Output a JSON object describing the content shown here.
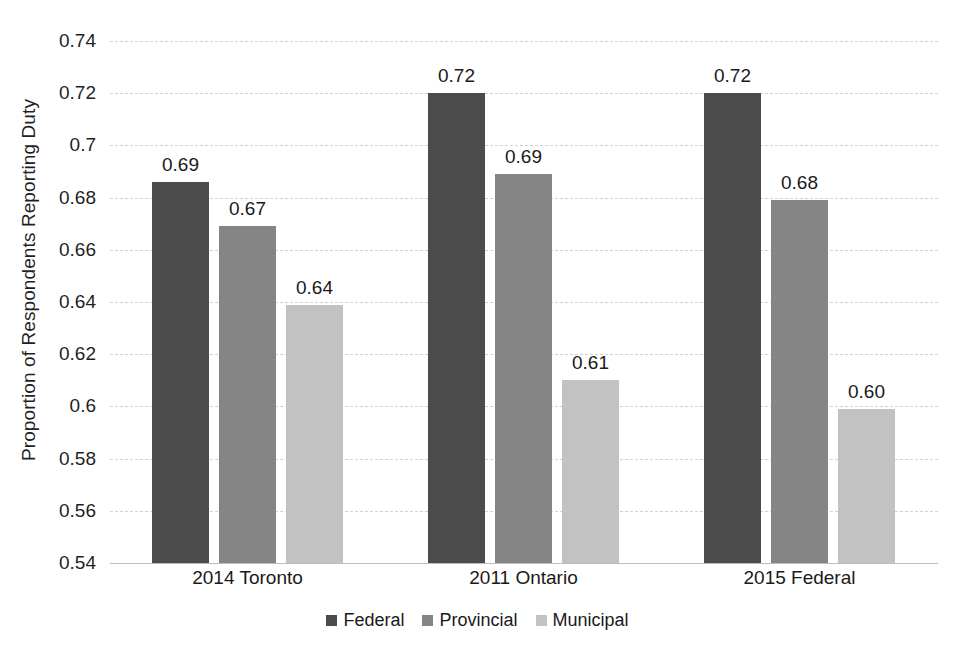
{
  "chart_data": {
    "type": "bar",
    "title": "",
    "subtitle": "",
    "xlabel": "",
    "ylabel": "Proportion of Respondents Reporting Duty",
    "categories": [
      "2014 Toronto",
      "2011 Ontario",
      "2015 Federal"
    ],
    "series": [
      {
        "name": "Federal",
        "color": "#4b4b4b",
        "values": [
          0.686,
          0.72,
          0.72
        ],
        "labels": [
          "0.69",
          "0.72",
          "0.72"
        ]
      },
      {
        "name": "Provincial",
        "color": "#858585",
        "values": [
          0.669,
          0.689,
          0.679
        ],
        "labels": [
          "0.67",
          "0.69",
          "0.68"
        ]
      },
      {
        "name": "Municipal",
        "color": "#c2c2c2",
        "values": [
          0.639,
          0.61,
          0.599
        ],
        "labels": [
          "0.64",
          "0.61",
          "0.60"
        ]
      }
    ],
    "ylim": [
      0.54,
      0.74
    ],
    "ytick_step": 0.02,
    "ytick_labels": [
      "0.74",
      "0.72",
      "0.7",
      "0.68",
      "0.66",
      "0.64",
      "0.62",
      "0.6",
      "0.58",
      "0.56",
      "0.54"
    ],
    "ytick_values": [
      0.74,
      0.72,
      0.7,
      0.68,
      0.66,
      0.64,
      0.62,
      0.6,
      0.58,
      0.56,
      0.54
    ],
    "grid": true,
    "grid_color": "#d2d2d2",
    "legend_position": "bottom",
    "background": "#ffffff"
  }
}
